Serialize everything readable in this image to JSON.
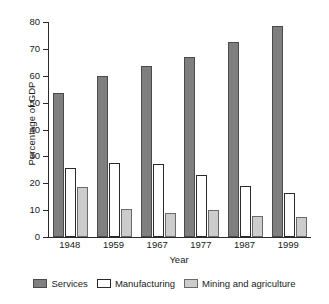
{
  "chart_data": {
    "type": "bar",
    "title": "",
    "xlabel": "Year",
    "ylabel": "Percentage of GDP",
    "categories": [
      "1948",
      "1959",
      "1967",
      "1977",
      "1987",
      "1999"
    ],
    "series": [
      {
        "name": "Services",
        "color": "#7f7f7f",
        "values": [
          53.5,
          60,
          63.5,
          67,
          72.5,
          78.5
        ]
      },
      {
        "name": "Manufacturing",
        "color": "#ffffff",
        "values": [
          25.5,
          27.5,
          27,
          23,
          19,
          16.5
        ]
      },
      {
        "name": "Mining and agriculture",
        "color": "#cccccc",
        "values": [
          18.5,
          10.5,
          9,
          10,
          8,
          7.5
        ]
      }
    ],
    "ylim": [
      0,
      80
    ],
    "yticks": [
      0,
      10,
      20,
      30,
      40,
      50,
      60,
      70,
      80
    ],
    "ytick_labels": [
      "0",
      "10",
      "20",
      "30",
      "40",
      "50",
      "60",
      "70",
      "80"
    ],
    "grid": false,
    "legend_position": "bottom"
  },
  "legend": {
    "items": [
      {
        "label": "Services",
        "swatch": "services"
      },
      {
        "label": "Manufacturing",
        "swatch": "manufacturing"
      },
      {
        "label": "Mining and agriculture",
        "swatch": "mining"
      }
    ]
  }
}
